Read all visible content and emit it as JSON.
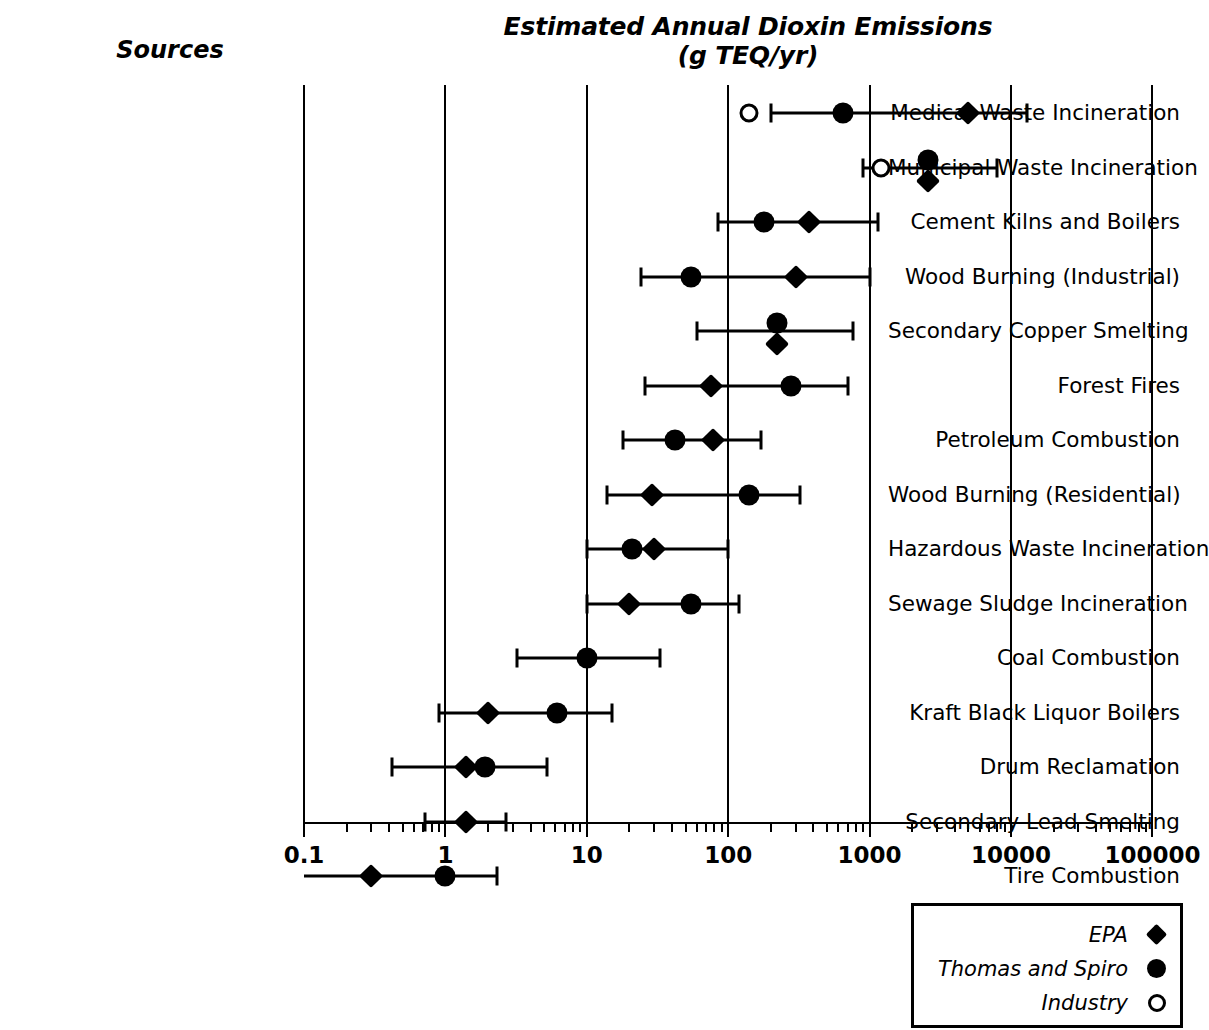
{
  "header": {
    "chart_title_line1": "Estimated Annual Dioxin Emissions",
    "chart_title_line2": "(g TEQ/yr)",
    "sources_heading": "Sources"
  },
  "legend": {
    "items": [
      {
        "label": "EPA",
        "symbol": "diamond"
      },
      {
        "label": "Thomas and Spiro",
        "symbol": "filled-circle"
      },
      {
        "label": "Industry",
        "symbol": "open-circle"
      }
    ]
  },
  "chart_data": {
    "type": "scatter",
    "title": "Estimated Annual Dioxin Emissions (g TEQ/yr)",
    "xlabel": "g TEQ/yr",
    "ylabel": "Sources",
    "xscale": "log",
    "xlim": [
      0.1,
      100000
    ],
    "xticks": [
      0.1,
      1,
      10,
      100,
      1000,
      10000,
      100000
    ],
    "xtick_labels": [
      "0.1",
      "1",
      "10",
      "100",
      "1000",
      "10000",
      "100000"
    ],
    "grid": "vertical-major",
    "legend_position": "bottom-right",
    "series": [
      {
        "name": "EPA",
        "symbol": "diamond"
      },
      {
        "name": "Thomas and Spiro",
        "symbol": "filled-circle"
      },
      {
        "name": "Industry",
        "symbol": "open-circle"
      }
    ],
    "categories": [
      "Medical Waste Incineration",
      "Municipal Waste Incineration",
      "Cement Kilns and Boilers",
      "Wood Burning (Industrial)",
      "Secondary Copper Smelting",
      "Forest Fires",
      "Petroleum Combustion",
      "Wood Burning (Residential)",
      "Hazardous Waste Incineration",
      "Sewage Sludge Incineration",
      "Coal Combustion",
      "Kraft Black Liquor Boilers",
      "Drum Reclamation",
      "Secondary Lead Smelting",
      "Tire Combustion"
    ],
    "rows": [
      {
        "category": "Medical Waste Incineration",
        "range_low": 200,
        "range_high": 13000,
        "epa": 5000,
        "thomas_spiro": 650,
        "industry": 140
      },
      {
        "category": "Municipal Waste Incineration",
        "range_low": 900,
        "range_high": 8000,
        "epa": 2600,
        "thomas_spiro": 2600,
        "industry": 1200
      },
      {
        "category": "Cement Kilns and Boilers",
        "range_low": 85,
        "range_high": 1150,
        "epa": 370,
        "thomas_spiro": 180,
        "industry": null
      },
      {
        "category": "Wood Burning (Industrial)",
        "range_low": 24,
        "range_high": 1000,
        "epa": 300,
        "thomas_spiro": 55,
        "industry": null
      },
      {
        "category": "Secondary Copper Smelting",
        "range_low": 60,
        "range_high": 760,
        "epa": 220,
        "thomas_spiro": 220,
        "industry": null
      },
      {
        "category": "Forest Fires",
        "range_low": 26,
        "range_high": 700,
        "epa": 75,
        "thomas_spiro": 280,
        "industry": null
      },
      {
        "category": "Petroleum Combustion",
        "range_low": 18,
        "range_high": 170,
        "epa": 78,
        "thomas_spiro": 42,
        "industry": null
      },
      {
        "category": "Wood Burning (Residential)",
        "range_low": 14,
        "range_high": 320,
        "epa": 29,
        "thomas_spiro": 140,
        "industry": null
      },
      {
        "category": "Hazardous Waste Incineration",
        "range_low": 10,
        "range_high": 100,
        "epa": 30,
        "thomas_spiro": 21,
        "industry": null
      },
      {
        "category": "Sewage Sludge Incineration",
        "range_low": 10,
        "range_high": 120,
        "epa": 20,
        "thomas_spiro": 55,
        "industry": null
      },
      {
        "category": "Coal Combustion",
        "range_low": 3.2,
        "range_high": 33,
        "epa": null,
        "thomas_spiro": 10,
        "industry": null
      },
      {
        "category": "Kraft Black Liquor Boilers",
        "range_low": 0.9,
        "range_high": 15,
        "epa": 2.0,
        "thomas_spiro": 6.2,
        "industry": null
      },
      {
        "category": "Drum Reclamation",
        "range_low": 0.42,
        "range_high": 5.2,
        "epa": 1.4,
        "thomas_spiro": 1.9,
        "industry": null
      },
      {
        "category": "Secondary Lead Smelting",
        "range_low": 0.72,
        "range_high": 2.7,
        "epa": 1.4,
        "thomas_spiro": null,
        "industry": null
      },
      {
        "category": "Tire Combustion",
        "range_low": 0.1,
        "range_high": 2.3,
        "epa": 0.3,
        "thomas_spiro": 1.0,
        "industry": null
      }
    ]
  }
}
